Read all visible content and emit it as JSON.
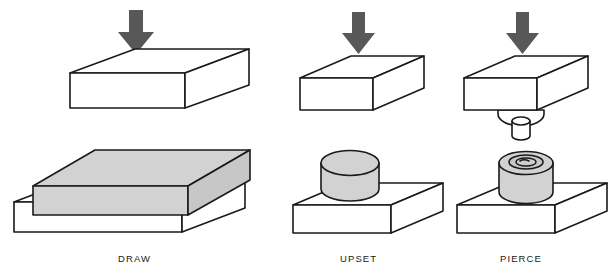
{
  "figure": {
    "background_color": "#ffffff",
    "line_color": "#1a1a1a",
    "formed_part_fill": "#d2d2d2",
    "blank_fill": "#ffffff",
    "arrow_color": "#585858",
    "label_color": "#1a1a1a"
  },
  "columns": [
    {
      "id": "draw",
      "label": "DRAW",
      "top": {
        "arrow": "down-arrow",
        "workpiece": "wide-flat-rectangular-block",
        "tooling": "flat-punch"
      },
      "bottom": {
        "formed_part": "wide-thick-rectangular-slab",
        "formed_part_shape": "block",
        "die": "flat-anvil-slab"
      }
    },
    {
      "id": "upset",
      "label": "UPSET",
      "top": {
        "arrow": "down-arrow",
        "workpiece": "small-rectangular-block",
        "tooling": "flat-punch"
      },
      "bottom": {
        "formed_part": "short-wide-cylinder",
        "formed_part_shape": "cylinder",
        "die": "flat-anvil-slab"
      }
    },
    {
      "id": "pierce",
      "label": "PIERCE",
      "top": {
        "arrow": "down-arrow",
        "workpiece": "small-rectangular-block-with-punch-boss",
        "tooling": "pierce-punch-pin"
      },
      "bottom": {
        "formed_part": "tall-cylinder-with-pierced-hole",
        "formed_part_shape": "cylinder-with-hole",
        "die": "flat-anvil-slab"
      }
    }
  ]
}
